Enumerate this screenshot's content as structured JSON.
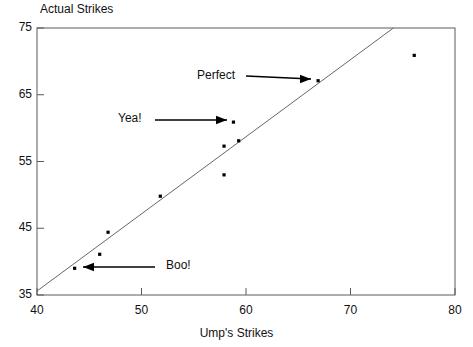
{
  "chart_data": {
    "type": "scatter",
    "title": "",
    "xlabel": "Ump's Strikes",
    "ylabel": "Actual Strikes",
    "xlim": [
      40,
      80
    ],
    "ylim": [
      35,
      75
    ],
    "xticks": [
      40,
      50,
      60,
      70,
      80
    ],
    "yticks": [
      35,
      45,
      55,
      65,
      75
    ],
    "xtick_labels": [
      "40",
      "50",
      "60",
      "70",
      "80"
    ],
    "ytick_labels": [
      "35",
      "45",
      "55",
      "65",
      "75"
    ],
    "grid": false,
    "legend": "none",
    "series": [
      {
        "name": "games",
        "marker": "square-dot",
        "color": "#000000",
        "points": [
          {
            "x": 43.6,
            "y": 39.0
          },
          {
            "x": 46.0,
            "y": 41.1
          },
          {
            "x": 46.8,
            "y": 44.4
          },
          {
            "x": 51.8,
            "y": 49.8
          },
          {
            "x": 57.9,
            "y": 53.0
          },
          {
            "x": 57.9,
            "y": 57.3
          },
          {
            "x": 59.3,
            "y": 58.1
          },
          {
            "x": 58.8,
            "y": 60.9
          },
          {
            "x": 66.9,
            "y": 67.1
          },
          {
            "x": 76.1,
            "y": 70.9
          }
        ]
      }
    ],
    "reference_line": {
      "name": "identity-line",
      "description": "y = x diagonal reference line",
      "from": {
        "x": 40.0,
        "y": 35.6
      },
      "to": {
        "x": 74.1,
        "y": 75.0
      },
      "color": "#555555"
    },
    "annotations": [
      {
        "id": "perfect",
        "label": "Perfect",
        "text_x": 197,
        "text_y": 68,
        "arrow_direction": "right",
        "arrow_x1": 246,
        "arrow_y1": 76,
        "arrow_x2": 311,
        "arrow_y2": 79,
        "target_point": {
          "x": 66.9,
          "y": 67.1
        }
      },
      {
        "id": "yea",
        "label": "Yea!",
        "text_x": 118,
        "text_y": 111,
        "arrow_direction": "right",
        "arrow_x1": 155,
        "arrow_y1": 120,
        "arrow_x2": 227,
        "arrow_y2": 120,
        "target_point": {
          "x": 58.8,
          "y": 60.9
        }
      },
      {
        "id": "boo",
        "label": "Boo!",
        "text_x": 166,
        "text_y": 258,
        "arrow_direction": "left",
        "arrow_x1": 155,
        "arrow_y1": 267,
        "arrow_x2": 83,
        "arrow_y2": 267,
        "target_point": {
          "x": 43.6,
          "y": 39.0
        }
      }
    ]
  },
  "axes": {
    "y_title": "Actual Strikes",
    "x_title": "Ump's Strikes",
    "y_tick_labels": [
      "75",
      "65",
      "55",
      "45",
      "35"
    ],
    "x_tick_labels": [
      "40",
      "50",
      "60",
      "70",
      "80"
    ]
  },
  "colors": {
    "frame": "#555555",
    "marker": "#000000",
    "line": "#666666",
    "text": "#111111",
    "background": "#ffffff"
  }
}
